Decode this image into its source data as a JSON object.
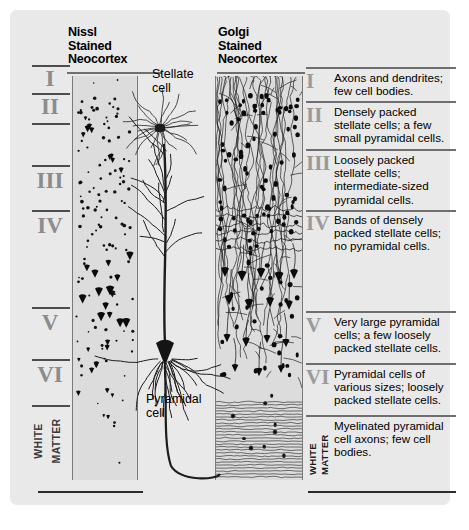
{
  "figure": {
    "background_color": "#e9e9e9",
    "column_fill": "#dcdcdc",
    "numeral_color": "#8c8c8c",
    "ink_color": "#1a1a1a"
  },
  "columns": {
    "nissl_heading": "Nissl\nStained\nNeocortex",
    "golgi_heading": "Golgi\nStained\nNeocortex"
  },
  "callouts": {
    "stellate": "Stellate\ncell",
    "pyramidal": "Pyramidal\ncell"
  },
  "left_labels": [
    {
      "numeral": "I"
    },
    {
      "numeral": "II"
    },
    {
      "numeral": "III"
    },
    {
      "numeral": "IV"
    },
    {
      "numeral": "V"
    },
    {
      "numeral": "VI"
    },
    {
      "numeral": "WHITE\nMATTER"
    }
  ],
  "white_matter_label": {
    "line1": "WHITE",
    "line2": "MATTER"
  },
  "layers": [
    {
      "numeral": "I",
      "description": "Axons and dendrites;\nfew cell bodies."
    },
    {
      "numeral": "II",
      "description": "Densely packed\nstellate cells; a few\nsmall pyramidal cells."
    },
    {
      "numeral": "III",
      "description": "Loosely packed\nstellate cells;\nintermediate-sized\npyramidal cells."
    },
    {
      "numeral": "IV",
      "description": "Bands of densely\npacked stellate cells;\nno pyramidal cells."
    },
    {
      "numeral": "V",
      "description": "Very large pyramidal\ncells; a few loosely\npacked stellate cells."
    },
    {
      "numeral": "VI",
      "description": "Pyramidal cells of\nvarious sizes; loosely\npacked stellate cells."
    },
    {
      "numeral": "WHITE MATTER",
      "description": "Myelinated pyramidal\ncell axons; few cell\nbodies."
    }
  ],
  "symbols": {
    "pyramidal_cell": "black-triangle",
    "stellate_cell": "black-dot",
    "myelinated_axon": "horizontal-wavy-line"
  }
}
